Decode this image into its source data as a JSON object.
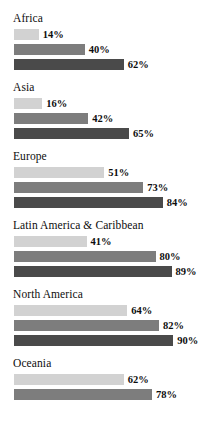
{
  "chart_data": {
    "type": "bar",
    "orientation": "horizontal",
    "title": "",
    "subtitle": "",
    "xlabel": "",
    "ylabel": "",
    "xlim": [
      0,
      100
    ],
    "grid": false,
    "legend": "none",
    "value_suffix": "%",
    "categories": [
      "Africa",
      "Asia",
      "Europe",
      "Latin America & Caribbean",
      "North America",
      "Oceania"
    ],
    "series": [
      {
        "name": "series-1",
        "color": "#d2d2d2",
        "values": [
          14,
          16,
          51,
          41,
          64,
          62
        ]
      },
      {
        "name": "series-2",
        "color": "#7d7d7d",
        "values": [
          40,
          42,
          73,
          80,
          82,
          78
        ]
      },
      {
        "name": "series-3",
        "color": "#4a4a4a",
        "values": [
          62,
          65,
          84,
          89,
          90,
          null
        ]
      }
    ],
    "groups": [
      {
        "label": "Africa",
        "bars": [
          {
            "value": 14,
            "label": "14%",
            "series": 0
          },
          {
            "value": 40,
            "label": "40%",
            "series": 1
          },
          {
            "value": 62,
            "label": "62%",
            "series": 2
          }
        ]
      },
      {
        "label": "Asia",
        "bars": [
          {
            "value": 16,
            "label": "16%",
            "series": 0
          },
          {
            "value": 42,
            "label": "42%",
            "series": 1
          },
          {
            "value": 65,
            "label": "65%",
            "series": 2
          }
        ]
      },
      {
        "label": "Europe",
        "bars": [
          {
            "value": 51,
            "label": "51%",
            "series": 0
          },
          {
            "value": 73,
            "label": "73%",
            "series": 1
          },
          {
            "value": 84,
            "label": "84%",
            "series": 2
          }
        ]
      },
      {
        "label": "Latin America & Caribbean",
        "bars": [
          {
            "value": 41,
            "label": "41%",
            "series": 0
          },
          {
            "value": 80,
            "label": "80%",
            "series": 1
          },
          {
            "value": 89,
            "label": "89%",
            "series": 2
          }
        ]
      },
      {
        "label": "North America",
        "bars": [
          {
            "value": 64,
            "label": "64%",
            "series": 0
          },
          {
            "value": 82,
            "label": "82%",
            "series": 1
          },
          {
            "value": 90,
            "label": "90%",
            "series": 2
          }
        ]
      },
      {
        "label": "Oceania",
        "bars": [
          {
            "value": 62,
            "label": "62%",
            "series": 0
          },
          {
            "value": 78,
            "label": "78%",
            "series": 1
          }
        ]
      }
    ]
  },
  "render": {
    "px_per_percent": 1.77
  }
}
